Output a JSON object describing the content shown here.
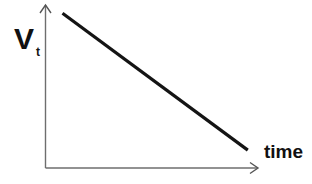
{
  "chart_data": {
    "type": "line",
    "title": "",
    "xlabel": "time",
    "ylabel": "V",
    "ylabel_subscript": "t",
    "x_ticks": [],
    "y_ticks": [],
    "grid": false,
    "legend": null,
    "series": [
      {
        "name": "V_t",
        "description": "linearly decreasing with time",
        "x": [
          0.08,
          0.95
        ],
        "y": [
          0.95,
          0.11
        ]
      }
    ],
    "xlim": [
      0,
      1
    ],
    "ylim": [
      0,
      1
    ],
    "colors": {
      "line": "#141414",
      "axes": "#6e6e6e"
    }
  }
}
